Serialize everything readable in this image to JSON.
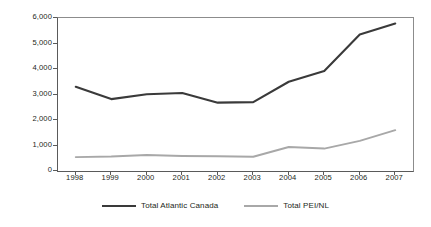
{
  "chart_data": {
    "type": "line",
    "title": "",
    "subtitle": "",
    "xlabel": "",
    "ylabel": "",
    "categories": [
      "1998",
      "1999",
      "2000",
      "2001",
      "2002",
      "2003",
      "2004",
      "2005",
      "2006",
      "2007"
    ],
    "series": [
      {
        "name": "Total Atlantic Canada",
        "color": "#3a3a3a",
        "values": [
          3300,
          2820,
          3010,
          3060,
          2680,
          2700,
          3500,
          3920,
          5350,
          5780
        ]
      },
      {
        "name": "Total PEI/NL",
        "color": "#a8a8a8",
        "values": [
          545,
          570,
          630,
          590,
          580,
          560,
          940,
          880,
          1180,
          1600
        ]
      }
    ],
    "ylim": [
      0,
      6000
    ],
    "ytick_values": [
      0,
      1000,
      2000,
      3000,
      4000,
      5000,
      6000
    ],
    "ytick_labels": [
      "0",
      "1,000",
      "2,000",
      "3,000",
      "4,000",
      "5,000",
      "6,000"
    ],
    "grid": false,
    "legend_position": "bottom"
  },
  "legend": {
    "entries": [
      {
        "label": "Total Atlantic Canada",
        "color": "#3a3a3a"
      },
      {
        "label": "Total PEI/NL",
        "color": "#a8a8a8"
      }
    ]
  },
  "colors": {
    "series_dark": "#3a3a3a",
    "series_light": "#a8a8a8",
    "axis": "#5a5a5a",
    "frame": "#8c8c8c",
    "text": "#231f20",
    "background": "#ffffff"
  }
}
